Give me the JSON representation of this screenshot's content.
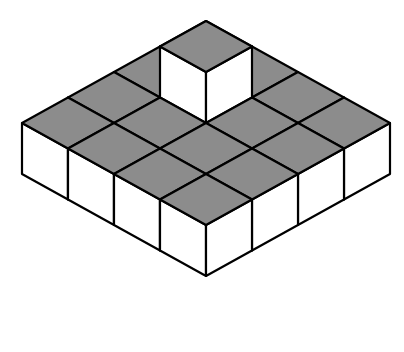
{
  "figure": {
    "base_grid": {
      "rows": 4,
      "cols": 4
    },
    "tower": {
      "row": 1,
      "col": 1,
      "height": 2
    },
    "total_cubes": 17
  },
  "colors": {
    "top_face": "#8c8c8c",
    "side_face": "#ffffff",
    "edge": "#000000"
  },
  "geometry": {
    "origin": [
      206,
      72
    ],
    "u": [
      -46,
      25.5
    ],
    "v": [
      46,
      25.5
    ],
    "h": 51
  }
}
